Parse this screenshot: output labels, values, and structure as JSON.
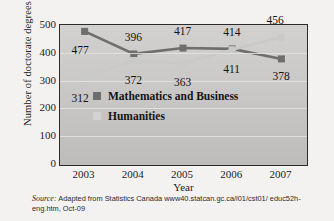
{
  "chart_data": {
    "type": "line",
    "title": "",
    "xlabel": "Year",
    "ylabel": "Number of doctorate degrees",
    "categories": [
      "2003",
      "2004",
      "2005",
      "2006",
      "2007"
    ],
    "x": [
      2003,
      2004,
      2005,
      2006,
      2007
    ],
    "ylim": [
      0,
      500
    ],
    "yticks": [
      "0",
      "100",
      "200",
      "300",
      "400",
      "500"
    ],
    "ytick_values": [
      0,
      100,
      200,
      300,
      400,
      500
    ],
    "grid": true,
    "legend_position": "inside-center",
    "series": [
      {
        "name": "Mathematics and Business",
        "color": "#6e6e6e",
        "values": [
          477,
          396,
          417,
          414,
          378
        ],
        "labels": [
          "477",
          "396",
          "417",
          "414",
          "378"
        ]
      },
      {
        "name": "Humanities",
        "color": "#c9c9c7",
        "values": [
          312,
          372,
          363,
          411,
          456
        ],
        "labels": [
          "312",
          "372",
          "363",
          "411",
          "456"
        ]
      }
    ]
  },
  "legend": {
    "items": [
      {
        "label": "Mathematics and Business",
        "color": "#6e6e6e"
      },
      {
        "label": "Humanities",
        "color": "#d2d2d0"
      }
    ]
  },
  "source": {
    "prefix": "Source:",
    "text": " Adapted from Statistics Canada www40.statcan.gc.ca/l01/cst01/ educ52h-eng.htm, Oct-09"
  }
}
